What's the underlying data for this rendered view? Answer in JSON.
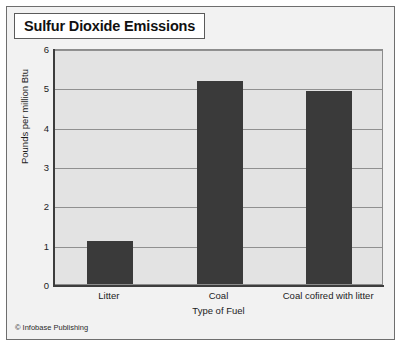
{
  "figure": {
    "title": "Sulfur Dioxide Emissions",
    "credit": "© Infobase Publishing",
    "background_color": "#f2f2f2",
    "plot_background_color": "#e3e3e3",
    "bar_color": "#3a3a3a",
    "gridline_color": "#909090",
    "axis_color": "#3d3d3d"
  },
  "chart_data": {
    "type": "bar",
    "title": "Sulfur Dioxide Emissions",
    "categories": [
      "Litter",
      "Coal",
      "Coal cofired with litter"
    ],
    "values": [
      1.1,
      5.15,
      4.9
    ],
    "xlabel": "Type of Fuel",
    "ylabel": "Pounds per million Btu",
    "ylim": [
      0,
      6
    ],
    "yticks": [
      0,
      1,
      2,
      3,
      4,
      5,
      6
    ],
    "ytick_labels": [
      "0",
      "1",
      "2",
      "3",
      "4",
      "5",
      "6"
    ],
    "grid": true,
    "legend": false
  }
}
